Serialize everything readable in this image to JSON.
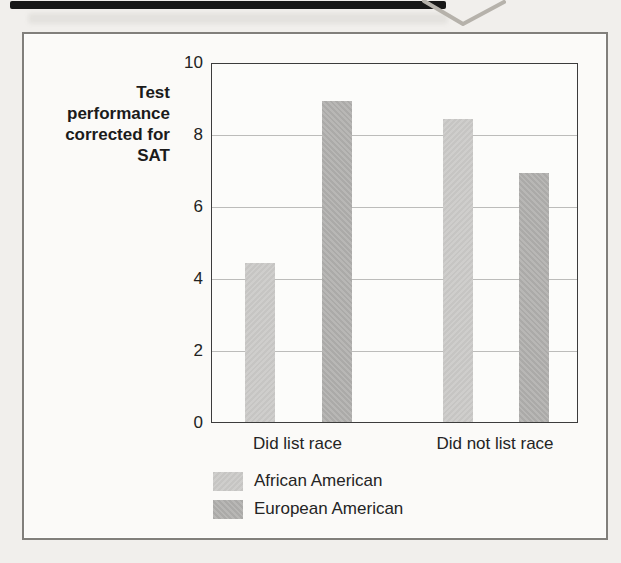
{
  "chart_data": {
    "type": "bar",
    "title": "",
    "ylabel_lines": [
      "Test",
      "performance",
      "corrected for",
      "SAT"
    ],
    "categories": [
      "Did list race",
      "Did not list race"
    ],
    "series": [
      {
        "name": "African American",
        "color_hex": "#cdccca",
        "values": [
          4.45,
          8.45
        ]
      },
      {
        "name": "European American",
        "color_hex": "#b5b4b2",
        "values": [
          8.95,
          6.95
        ]
      }
    ],
    "ylim": [
      0,
      10
    ],
    "yticks": [
      0,
      2,
      4,
      6,
      8,
      10
    ],
    "grid": true,
    "grid_values": [
      2,
      4,
      6,
      8
    ],
    "legend_position": "bottom-left",
    "bar_arrangement": "grouped"
  },
  "colors": {
    "page_background": "#f1efec",
    "figure_background": "#fbfaf8",
    "figure_border": "#817f7b",
    "plot_border": "#3c3c3c",
    "gridline": "#bcbcba",
    "text": "#1f1f1f",
    "scan_strip": "#171717",
    "watermark_stroke": "#b6b2ab"
  }
}
